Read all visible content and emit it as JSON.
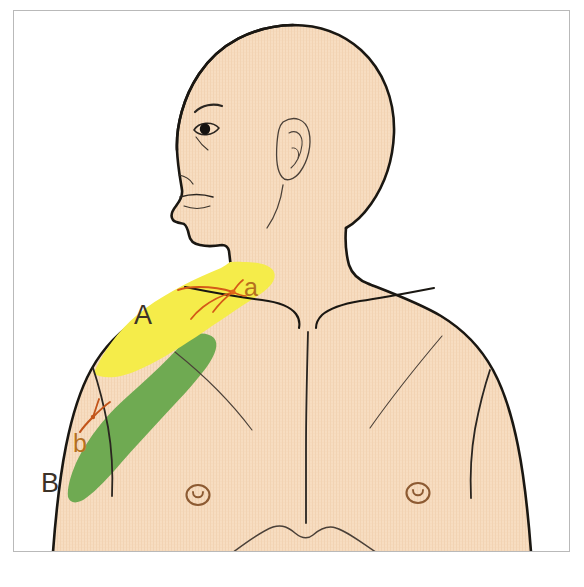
{
  "figure": {
    "frame": {
      "border_color": "#b9b9b9",
      "background": "#ffffff"
    }
  },
  "colors": {
    "skin": "#f7ddc1",
    "skin_texture_line": "#efcfae",
    "outline": "#1a1712",
    "inner_line": "#3a322a",
    "region_a_yellow": "#f5ec4a",
    "region_b_green": "#6faa52",
    "nerve_orange": "#e2661a",
    "nerve_dark": "#c2541a",
    "label_dark": "#3c3228",
    "label_brown": "#b5701f",
    "nipple_brown": "#8c5a32"
  },
  "regions": [
    {
      "id": "region-a",
      "label": "A",
      "label_color": "#3c3228",
      "fill": "#f5ec4a",
      "name": "supraclavicular-shoulder-region",
      "label_x": 143,
      "label_y": 315
    },
    {
      "id": "region-b",
      "label": "B",
      "label_color": "#3c3228",
      "fill": "#6faa52",
      "name": "upper-lateral-arm-region",
      "label_x": 50,
      "label_y": 483
    }
  ],
  "nerves": [
    {
      "id": "nerve-a",
      "label": "a",
      "label_color": "#b5701f",
      "stroke": "#d45a18",
      "name": "supraclavicular-nerve-branches",
      "label_x": 248,
      "label_y": 293
    },
    {
      "id": "nerve-b",
      "label": "b",
      "label_color": "#b5701f",
      "stroke": "#c2541a",
      "name": "axillary-nerve-cutaneous-branch",
      "label_x": 79,
      "label_y": 445
    }
  ],
  "anatomy_marks": [
    {
      "name": "nipple-left",
      "cx": 198,
      "cy": 495
    },
    {
      "name": "nipple-right",
      "cx": 418,
      "cy": 493
    },
    {
      "name": "eye",
      "cx": 206,
      "cy": 131
    },
    {
      "name": "ear",
      "cx": 294,
      "cy": 143
    },
    {
      "name": "sternum-midline",
      "x": 307,
      "y_top": 340,
      "y_bottom": 520
    },
    {
      "name": "costal-margin",
      "x": 307,
      "y": 530
    }
  ],
  "labels": {
    "region_a": "A",
    "region_b": "B",
    "nerve_a": "a",
    "nerve_b": "b"
  }
}
